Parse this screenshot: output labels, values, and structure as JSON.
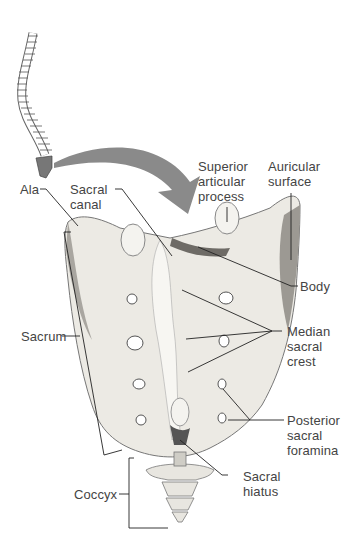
{
  "figure": {
    "colors": {
      "bone_light": "#f2f1ec",
      "bone_mid": "#d8d6cf",
      "bone_shadow": "#8e8c86",
      "arrow": "#8a8a8a",
      "leader_line": "#222222",
      "label_text": "#444444"
    },
    "labels": {
      "ala": "Ala",
      "sacral_canal": "Sacral\ncanal",
      "superior_articular_process": "Superior\narticular\nprocess",
      "auricular_surface": "Auricular\nsurface",
      "body": "Body",
      "median_sacral_crest": "Median\nsacral\ncrest",
      "sacrum": "Sacrum",
      "posterior_sacral_foramina": "Posterior\nsacral\nforamina",
      "sacral_hiatus": "Sacral\nhiatus",
      "coccyx": "Coccyx"
    },
    "icons": {
      "spine_thumbnail": "vertebral-column-icon",
      "orientation_arrow": "curved-arrow-icon"
    }
  }
}
